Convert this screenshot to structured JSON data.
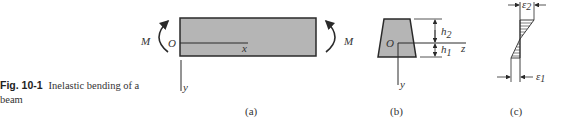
{
  "caption": {
    "figure_number": "Fig. 10-1",
    "text": "Inelastic bending of a beam"
  },
  "panel_a": {
    "label": "(a)",
    "moment_left": "M",
    "moment_right": "M",
    "origin": "O",
    "axis_x": "x",
    "axis_y": "y"
  },
  "panel_b": {
    "label": "(b)",
    "origin": "O",
    "axis_z": "z",
    "axis_y": "y",
    "dim_top": "h",
    "dim_top_sub": "2",
    "dim_bottom": "h",
    "dim_bottom_sub": "1"
  },
  "panel_c": {
    "label": "(c)",
    "strain_top": "ε",
    "strain_top_sub": "2",
    "strain_bottom": "ε",
    "strain_bottom_sub": "1"
  },
  "colors": {
    "fill_gray": "#b5b5b5",
    "stroke": "#2a2a2a"
  }
}
